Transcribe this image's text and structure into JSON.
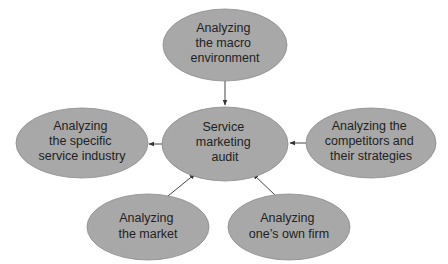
{
  "diagram": {
    "type": "hub-and-spoke",
    "colors": {
      "node_fill": "#a8a8a8",
      "node_stroke": "#8c8c8c",
      "text": "#222222",
      "edge": "#444444",
      "background": "#ffffff"
    },
    "nodes": [
      {
        "id": "macro",
        "lines": [
          "Analyzing",
          "the macro",
          "environment"
        ]
      },
      {
        "id": "audit",
        "lines": [
          "Service",
          "marketing",
          "audit"
        ]
      },
      {
        "id": "industry",
        "lines": [
          "Analyzing",
          "the specific",
          "service industry"
        ]
      },
      {
        "id": "competitors",
        "lines": [
          "Analyzing the",
          "competitors and",
          "their strategies"
        ]
      },
      {
        "id": "market",
        "lines": [
          "Analyzing",
          "the market"
        ]
      },
      {
        "id": "own_firm",
        "lines": [
          "Analyzing",
          "one’s own firm"
        ]
      }
    ],
    "edges": [
      {
        "from": "macro",
        "to": "audit"
      },
      {
        "from": "audit",
        "to": "industry"
      },
      {
        "from": "competitors",
        "to": "audit"
      },
      {
        "from": "market",
        "to": "audit"
      },
      {
        "from": "own_firm",
        "to": "audit"
      }
    ]
  }
}
